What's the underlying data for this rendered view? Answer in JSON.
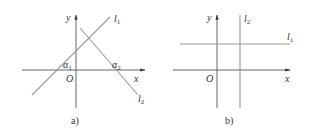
{
  "figure": {
    "panels": [
      {
        "id": "a",
        "caption": "a)",
        "axes": {
          "x_label": "x",
          "y_label": "y",
          "origin_label": "O"
        },
        "lines": [
          {
            "name": "l1",
            "label": "l",
            "subscript": "1",
            "description": "line with positive slope"
          },
          {
            "name": "l2",
            "label": "l",
            "subscript": "2",
            "description": "line with negative slope"
          }
        ],
        "angles": [
          {
            "name": "alpha1",
            "label": "α",
            "subscript": "1",
            "description": "inclination angle of l1 with x-axis"
          },
          {
            "name": "alpha2",
            "label": "α",
            "subscript": "2",
            "description": "inclination angle of l2 with x-axis"
          }
        ]
      },
      {
        "id": "b",
        "caption": "b)",
        "axes": {
          "x_label": "x",
          "y_label": "y",
          "origin_label": "O"
        },
        "lines": [
          {
            "name": "l1",
            "label": "l",
            "subscript": "1",
            "description": "horizontal line parallel to x-axis"
          },
          {
            "name": "l2",
            "label": "l",
            "subscript": "2",
            "description": "vertical line parallel to y-axis"
          }
        ]
      }
    ],
    "colors": {
      "axis": "#555555",
      "line": "#999999",
      "text": "#333333",
      "background": "#ffffff"
    }
  }
}
